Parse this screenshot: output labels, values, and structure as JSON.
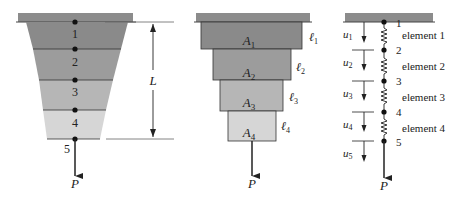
{
  "colors": {
    "wall": "#8c8c8c",
    "band1": "#8a8a8a",
    "band2": "#9c9c9c",
    "band3": "#b6b6b6",
    "band4": "#d6d6d6",
    "line": "#222222"
  },
  "figure_tapered": {
    "node_labels": [
      "1",
      "2",
      "3",
      "4",
      "5"
    ],
    "length_label": "L",
    "load_label": "P"
  },
  "figure_stepped": {
    "areas": [
      {
        "sym": "A",
        "sub": "1"
      },
      {
        "sym": "A",
        "sub": "2"
      },
      {
        "sym": "A",
        "sub": "3"
      },
      {
        "sym": "A",
        "sub": "4"
      }
    ],
    "lengths": [
      {
        "sym": "ℓ",
        "sub": "1"
      },
      {
        "sym": "ℓ",
        "sub": "2"
      },
      {
        "sym": "ℓ",
        "sub": "3"
      },
      {
        "sym": "ℓ",
        "sub": "4"
      }
    ],
    "load_label": "P"
  },
  "figure_springs": {
    "node_labels": [
      "1",
      "2",
      "3",
      "4",
      "5"
    ],
    "element_labels": [
      "element 1",
      "element 2",
      "element 3",
      "element 4"
    ],
    "displacements": [
      {
        "sym": "u",
        "sub": "1"
      },
      {
        "sym": "u",
        "sub": "2"
      },
      {
        "sym": "u",
        "sub": "3"
      },
      {
        "sym": "u",
        "sub": "4"
      },
      {
        "sym": "u",
        "sub": "5"
      }
    ],
    "load_label": "P"
  }
}
